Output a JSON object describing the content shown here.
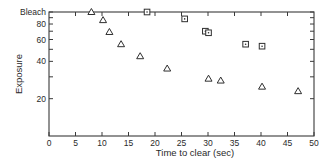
{
  "chart_data": {
    "type": "scatter",
    "title": "",
    "xlabel": "Time to clear (sec)",
    "ylabel": "Exposure",
    "xlim": [
      0,
      50
    ],
    "ylim": [
      10,
      100
    ],
    "yscale": "log",
    "x_ticks": [
      0,
      5,
      10,
      15,
      20,
      25,
      30,
      35,
      40,
      45,
      50
    ],
    "y_ticks": [
      {
        "value": 100,
        "label": "Bleach"
      },
      {
        "value": 80,
        "label": "80"
      },
      {
        "value": 60,
        "label": "60"
      },
      {
        "value": 40,
        "label": "40"
      },
      {
        "value": 20,
        "label": "20"
      }
    ],
    "y_minor_ticks": [
      90,
      70,
      50,
      30
    ],
    "grid": false,
    "legend": null,
    "series": [
      {
        "name": "triangles",
        "marker": "triangle",
        "points": [
          {
            "x": 8,
            "y": 100
          },
          {
            "x": 10.2,
            "y": 86
          },
          {
            "x": 11.4,
            "y": 69
          },
          {
            "x": 13.6,
            "y": 55
          },
          {
            "x": 17.2,
            "y": 44
          },
          {
            "x": 22.3,
            "y": 35
          },
          {
            "x": 30.1,
            "y": 29
          },
          {
            "x": 32.4,
            "y": 28
          },
          {
            "x": 40.2,
            "y": 25
          },
          {
            "x": 47.0,
            "y": 23
          }
        ]
      },
      {
        "name": "squares",
        "marker": "square",
        "points": [
          {
            "x": 18.5,
            "y": 100
          },
          {
            "x": 25.6,
            "y": 88
          },
          {
            "x": 29.5,
            "y": 70
          },
          {
            "x": 30.1,
            "y": 68
          },
          {
            "x": 37.1,
            "y": 55
          },
          {
            "x": 40.2,
            "y": 53
          }
        ]
      }
    ]
  },
  "labels": {
    "xlabel": "Time to clear (sec)",
    "ylabel": "Exposure",
    "bleach": "Bleach"
  }
}
